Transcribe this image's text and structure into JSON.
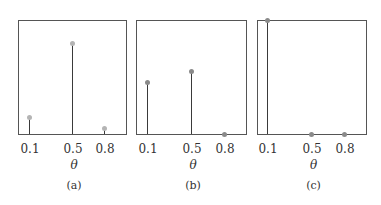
{
  "chart_data": [
    {
      "type": "stem",
      "caption": "(a)",
      "xlabel": "θ",
      "categories": [
        "0.1",
        "0.5",
        "0.8"
      ],
      "x": [
        0.1,
        0.5,
        0.8
      ],
      "values": [
        0.15,
        0.8,
        0.05
      ],
      "ylim": [
        0,
        1
      ],
      "marker_color": "#b4b4b4",
      "frame": {
        "left": 18,
        "top": 20,
        "right": 126,
        "bottom": 134
      },
      "stem_px": [
        29,
        72,
        104
      ]
    },
    {
      "type": "stem",
      "caption": "(b)",
      "xlabel": "θ",
      "categories": [
        "0.1",
        "0.5",
        "0.8"
      ],
      "x": [
        0.1,
        0.5,
        0.8
      ],
      "values": [
        0.46,
        0.55,
        0.0
      ],
      "ylim": [
        0,
        1
      ],
      "marker_color": "#8a8a8a",
      "frame": {
        "left": 136,
        "top": 20,
        "right": 246,
        "bottom": 134
      },
      "stem_px": [
        147,
        191,
        224
      ]
    },
    {
      "type": "stem",
      "caption": "(c)",
      "xlabel": "θ",
      "categories": [
        "0.1",
        "0.5",
        "0.8"
      ],
      "x": [
        0.1,
        0.5,
        0.8
      ],
      "values": [
        1.0,
        0.0,
        0.0
      ],
      "ylim": [
        0,
        1
      ],
      "marker_color": "#8a8a8a",
      "frame": {
        "left": 257,
        "top": 20,
        "right": 366,
        "bottom": 134
      },
      "stem_px": [
        267,
        311,
        344
      ]
    }
  ]
}
